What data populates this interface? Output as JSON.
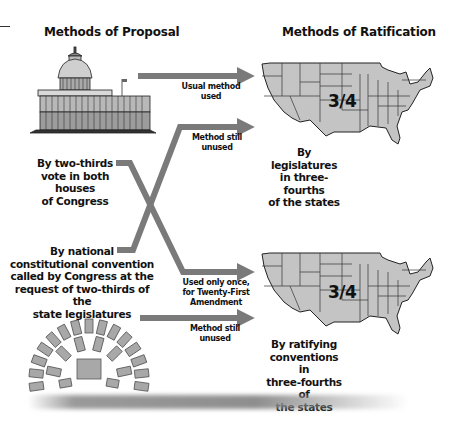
{
  "diagram": {
    "left_heading": "Methods of Proposal",
    "right_heading": "Methods of Ratification",
    "proposals": [
      {
        "id": "congress",
        "label": "By two-thirds vote in both houses of Congress",
        "lines": [
          "By two-thirds",
          "vote in both houses",
          "of Congress"
        ],
        "icon": "capitol-building-icon"
      },
      {
        "id": "convention",
        "label": "By national constitutional convention called by Congress at the request of two-thirds of the state legislatures",
        "lines": [
          "By national",
          "constitutional convention",
          "called by Congress at the",
          "request of two-thirds of the",
          "state legislatures"
        ],
        "icon": "convention-seating-icon"
      }
    ],
    "ratifications": [
      {
        "id": "legislatures",
        "lines": [
          "By legislatures",
          "in three-fourths",
          "of the states"
        ],
        "fraction": "3/4",
        "icon": "us-map-icon"
      },
      {
        "id": "conventions",
        "lines": [
          "By ratifying",
          "conventions in",
          "three-fourths of",
          "the states"
        ],
        "fraction": "3/4",
        "icon": "us-map-icon"
      }
    ],
    "arrows": [
      {
        "from": "congress",
        "to": "legislatures",
        "lines": [
          "Usual method",
          "used"
        ]
      },
      {
        "from": "convention",
        "to": "legislatures",
        "lines": [
          "Method still",
          "unused"
        ]
      },
      {
        "from": "congress",
        "to": "conventions",
        "lines": [
          "Used only once,",
          "for Twenty-First",
          "Amendment"
        ]
      },
      {
        "from": "convention",
        "to": "conventions",
        "lines": [
          "Method still",
          "unused"
        ]
      }
    ],
    "colors": {
      "arrow": "#7a7a7a",
      "map_fill": "#c4c4c4",
      "map_stroke": "#222222",
      "seat_fill": "#a8a8a8"
    }
  }
}
